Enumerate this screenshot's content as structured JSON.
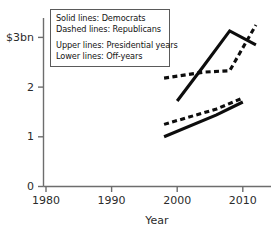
{
  "chart_data": {
    "type": "line",
    "title": "",
    "xlabel": "Year",
    "ylabel": "",
    "xlim": [
      1976,
      2014
    ],
    "ylim": [
      0,
      3.3
    ],
    "grid": false,
    "legend_position": "top-left-inset",
    "x_ticks": [
      "1980",
      "1990",
      "2000",
      "2010"
    ],
    "x_tick_values": [
      1980,
      1990,
      2000,
      2010
    ],
    "y_ticks": [
      "0",
      "1",
      "2",
      "$3bn"
    ],
    "y_tick_values": [
      0,
      1,
      2,
      3
    ],
    "units": "$bn",
    "series": [
      {
        "name": "Democrats, Presidential years",
        "style": "solid",
        "group": "upper",
        "x": [
          2000,
          2004,
          2008,
          2012
        ],
        "values": [
          1.72,
          2.42,
          3.13,
          2.85
        ]
      },
      {
        "name": "Republicans, Presidential years",
        "style": "dashed",
        "group": "upper",
        "x": [
          1998,
          2004,
          2008,
          2012
        ],
        "values": [
          2.18,
          2.3,
          2.33,
          3.25
        ]
      },
      {
        "name": "Republicans, Off-years",
        "style": "dashed",
        "group": "lower",
        "x": [
          1998,
          2006,
          2010
        ],
        "values": [
          1.25,
          1.56,
          1.78
        ]
      },
      {
        "name": "Democrats, Off-years",
        "style": "solid",
        "group": "lower",
        "x": [
          1998,
          2006,
          2010
        ],
        "values": [
          1.0,
          1.44,
          1.7
        ]
      }
    ],
    "annotations": []
  },
  "legend": {
    "line1": "Solid lines: Democrats",
    "line2": "Dashed lines: Republicans",
    "line3": "Upper lines: Presidential years",
    "line4": "Lower lines: Off-years"
  },
  "axes": {
    "x_label": "Year",
    "x_tick_0": "1980",
    "x_tick_1": "1990",
    "x_tick_2": "2000",
    "x_tick_3": "2010",
    "y_tick_0": "0",
    "y_tick_1": "1",
    "y_tick_2": "2",
    "y_tick_3": "$3bn"
  },
  "colors": {
    "series": "#0d0d0d",
    "axis": "#6d6d6d",
    "text": "#2b2b2b",
    "background": "#ffffff"
  }
}
